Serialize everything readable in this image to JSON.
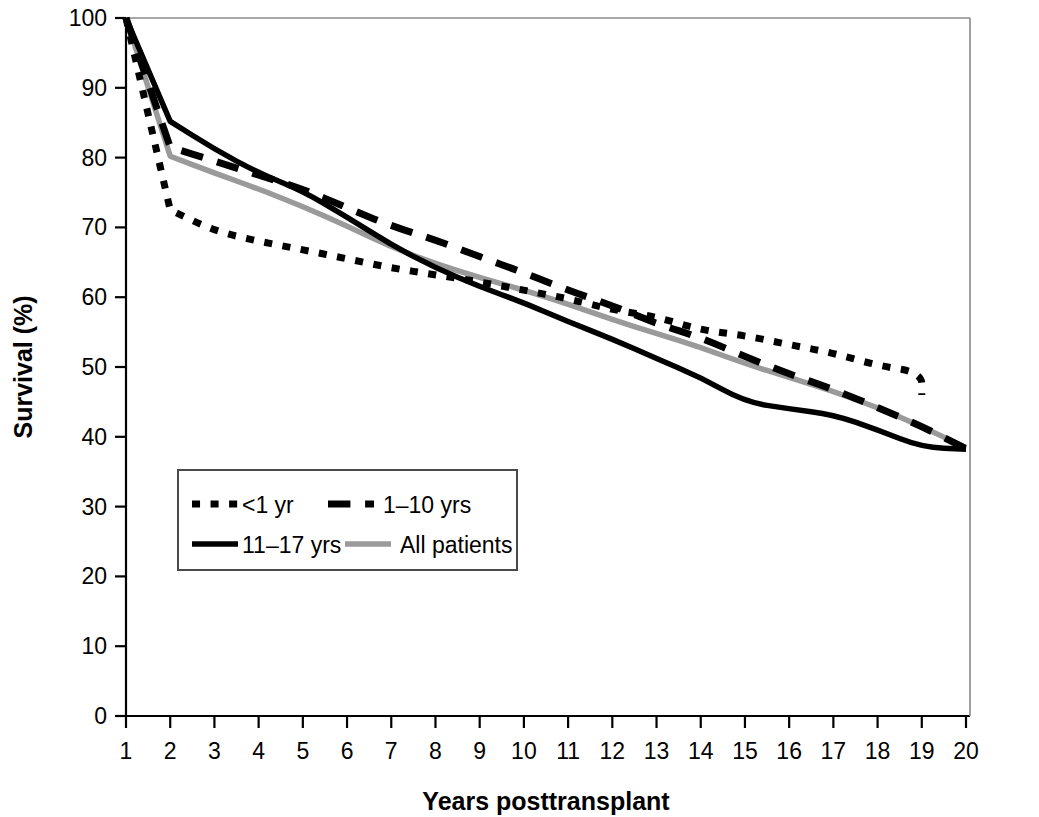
{
  "chart_data": {
    "type": "line",
    "title": "",
    "xlabel": "Years posttransplant",
    "ylabel": "Survival (%)",
    "xlim": [
      1,
      20
    ],
    "ylim": [
      0,
      100
    ],
    "grid": false,
    "legend_position": "inside-lower-left",
    "x_ticks": [
      "1",
      "2",
      "3",
      "4",
      "5",
      "6",
      "7",
      "8",
      "9",
      "10",
      "11",
      "12",
      "13",
      "14",
      "15",
      "16",
      "17",
      "18",
      "19",
      "20"
    ],
    "y_ticks": [
      "0",
      "10",
      "20",
      "30",
      "40",
      "50",
      "60",
      "70",
      "80",
      "90",
      "100"
    ],
    "x": [
      1,
      2,
      3,
      4,
      5,
      6,
      7,
      8,
      9,
      10,
      11,
      12,
      13,
      14,
      15,
      16,
      17,
      18,
      19,
      20
    ],
    "series": [
      {
        "name": "<1 yr",
        "style": "dotted",
        "color": "#000000",
        "values": [
          100,
          72.5,
          69.5,
          68,
          66.8,
          65.5,
          64.2,
          63.2,
          62.2,
          61,
          59.8,
          58.2,
          57.2,
          55.3,
          54.5,
          53.2,
          52,
          50.2,
          49.2,
          null
        ],
        "end_year": 19,
        "end_value": 46
      },
      {
        "name": "1–10 yrs",
        "style": "dashed",
        "color": "#000000",
        "values": [
          100,
          81.5,
          79.5,
          77.5,
          75.5,
          72.8,
          70.2,
          68.2,
          65.8,
          63.5,
          61,
          58.8,
          56.2,
          54.2,
          51.5,
          49,
          46.8,
          44.2,
          41.5,
          38.3
        ]
      },
      {
        "name": "11–17 yrs",
        "style": "solid",
        "color": "#000000",
        "values": [
          100,
          85.2,
          81.2,
          77.8,
          75.2,
          71.5,
          67.5,
          64.2,
          61.5,
          59.2,
          56.5,
          54,
          51.2,
          48.5,
          45,
          44,
          43.2,
          41,
          38.5,
          38.2
        ]
      },
      {
        "name": "All patients",
        "style": "solid",
        "color": "#9a9a9a",
        "values": [
          100,
          80.2,
          77.8,
          75.5,
          73,
          70.2,
          67.2,
          64.8,
          62.8,
          61,
          59,
          56.8,
          54.8,
          52.8,
          50.5,
          48.5,
          46.5,
          44.2,
          41.5,
          38.4
        ]
      }
    ]
  },
  "legend": {
    "entries": [
      {
        "label": "<1 yr",
        "style": "dotted",
        "color": "#000000"
      },
      {
        "label": "1–10 yrs",
        "style": "dashed",
        "color": "#000000"
      },
      {
        "label": "11–17 yrs",
        "style": "solid",
        "color": "#000000"
      },
      {
        "label": "All patients",
        "style": "solid",
        "color": "#9a9a9a"
      }
    ]
  },
  "axes": {
    "x_title": "Years posttransplant",
    "y_title": "Survival (%)"
  }
}
